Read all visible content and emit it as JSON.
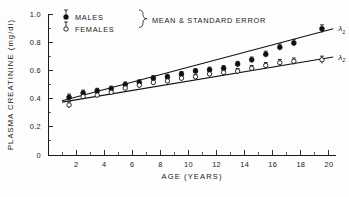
{
  "chart_data": {
    "type": "scatter",
    "title": "",
    "xlabel": "AGE (YEARS)",
    "ylabel": "PLASMA CREATININE (mg/dl)",
    "xlim": [
      0,
      20.5
    ],
    "ylim": [
      0,
      1.0
    ],
    "xticks": [
      2,
      4,
      6,
      8,
      10,
      12,
      14,
      16,
      18,
      20
    ],
    "xtick_labels": [
      "2",
      "4",
      "6",
      "8",
      "10",
      "12",
      "14",
      "16",
      "18",
      "20"
    ],
    "yticks": [
      0,
      0.2,
      0.4,
      0.6,
      0.8,
      1.0
    ],
    "ytick_labels": [
      "0",
      "0.2",
      "0.4",
      "0.6",
      "0.8",
      "1.0"
    ],
    "y_minor_ticks": [
      0.1,
      0.3,
      0.5,
      0.7,
      0.9
    ],
    "grid": false,
    "legend_position": "top-left",
    "legend_note": "MEAN & STANDARD ERROR",
    "series": [
      {
        "name": "MALES",
        "marker": "filled-circle",
        "fit_label": "λ",
        "fit_label_sub": "1",
        "fit_line": {
          "x0": 1.0,
          "y0": 0.385,
          "x1": 20.3,
          "y1": 0.895
        },
        "x": [
          1.5,
          2.5,
          3.5,
          4.5,
          5.5,
          6.5,
          7.5,
          8.5,
          9.5,
          10.5,
          11.5,
          12.5,
          13.5,
          14.5,
          15.5,
          16.5,
          17.5,
          19.5
        ],
        "values": [
          0.41,
          0.44,
          0.455,
          0.47,
          0.5,
          0.515,
          0.545,
          0.555,
          0.575,
          0.595,
          0.605,
          0.615,
          0.645,
          0.675,
          0.715,
          0.765,
          0.795,
          0.895
        ],
        "errors": [
          0.022,
          0.02,
          0.018,
          0.018,
          0.018,
          0.018,
          0.018,
          0.017,
          0.017,
          0.017,
          0.018,
          0.019,
          0.019,
          0.02,
          0.021,
          0.022,
          0.023,
          0.028
        ]
      },
      {
        "name": "FEMALES",
        "marker": "open-circle",
        "fit_label": "λ",
        "fit_label_sub": "2",
        "fit_line": {
          "x0": 1.0,
          "y0": 0.375,
          "x1": 20.3,
          "y1": 0.695
        },
        "x": [
          1.5,
          2.5,
          3.5,
          4.5,
          5.5,
          6.5,
          7.5,
          8.5,
          9.5,
          10.5,
          11.5,
          12.5,
          13.5,
          14.5,
          15.5,
          16.5,
          17.5,
          19.5
        ],
        "values": [
          0.355,
          0.415,
          0.425,
          0.445,
          0.475,
          0.495,
          0.515,
          0.525,
          0.545,
          0.555,
          0.575,
          0.585,
          0.595,
          0.615,
          0.635,
          0.655,
          0.665,
          0.675
        ],
        "errors": [
          0.022,
          0.02,
          0.018,
          0.018,
          0.018,
          0.018,
          0.018,
          0.017,
          0.017,
          0.017,
          0.018,
          0.019,
          0.019,
          0.02,
          0.021,
          0.022,
          0.023,
          0.026
        ]
      }
    ]
  }
}
